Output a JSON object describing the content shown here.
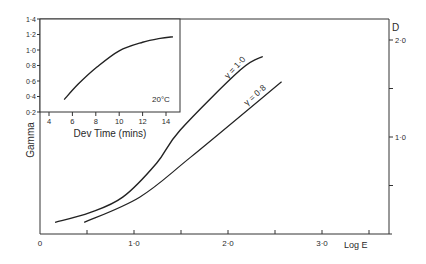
{
  "chart_data": [
    {
      "id": "main",
      "type": "line",
      "title": "",
      "xlabel": "Log E",
      "ylabel": "D",
      "xlim": [
        0,
        3.7
      ],
      "ylim": [
        0,
        2.2
      ],
      "x_ticks": [
        0,
        0.5,
        1.0,
        1.5,
        2.0,
        2.5,
        3.0,
        3.5
      ],
      "x_tick_labels": [
        "0",
        "",
        "1·0",
        "",
        "2·0",
        "",
        "3·0",
        ""
      ],
      "y_ticks": [
        0.5,
        1.0,
        1.5,
        2.0
      ],
      "y_tick_labels": [
        "",
        "1·0",
        "",
        "2·0"
      ],
      "y_axis_position": "right",
      "grid": false,
      "series": [
        {
          "name": "γ = 1·0",
          "label": "γ = 1·0",
          "x": [
            0.16,
            0.53,
            0.88,
            1.24,
            1.49,
            2.13,
            2.37
          ],
          "y": [
            0.12,
            0.22,
            0.38,
            0.73,
            1.07,
            1.69,
            1.83
          ]
        },
        {
          "name": "γ = 0·8",
          "label": "γ = 0·8",
          "x": [
            0.47,
            1.06,
            1.6,
            2.57
          ],
          "y": [
            0.12,
            0.38,
            0.79,
            1.57
          ]
        }
      ]
    },
    {
      "id": "inset",
      "type": "line",
      "title": "",
      "xlabel": "Dev Time (mins)",
      "ylabel": "Gamma",
      "annotation": "20°C",
      "xlim": [
        3.2,
        15.5
      ],
      "ylim": [
        0.2,
        1.4
      ],
      "x_ticks": [
        4,
        6,
        8,
        10,
        12,
        14
      ],
      "x_tick_labels": [
        "4",
        "6",
        "8",
        "10",
        "12",
        "14"
      ],
      "y_ticks": [
        0.2,
        0.4,
        0.6,
        0.8,
        1.0,
        1.2,
        1.4
      ],
      "y_tick_labels": [
        "0·2",
        "0·4",
        "0·6",
        "0·8",
        "1·0",
        "1·2",
        "1·4"
      ],
      "grid": false,
      "series": [
        {
          "name": "Gamma vs development time",
          "x": [
            5.3,
            6.5,
            8.1,
            10.0,
            12.0,
            13.5,
            14.6
          ],
          "y": [
            0.36,
            0.56,
            0.78,
            0.99,
            1.1,
            1.15,
            1.17
          ]
        }
      ]
    }
  ],
  "labels": {
    "main_xlabel": "Log E",
    "main_ylabel": "D",
    "inset_xlabel": "Dev Time (mins)",
    "inset_ylabel": "Gamma",
    "temperature": "20°C",
    "curve1": "γ = 1·0",
    "curve2": "γ = 0·8"
  }
}
